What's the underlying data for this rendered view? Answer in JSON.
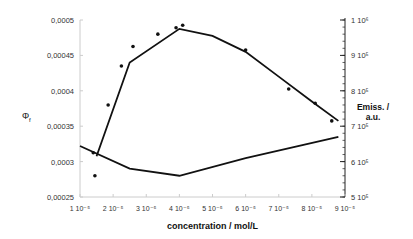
{
  "chart_data": {
    "type": "line",
    "title": "",
    "xlabel": "concentration / mol/L",
    "ylabel_left": "Φf",
    "ylabel_right": "Emiss. / a.u.",
    "xlim": [
      1e-05,
      9e-05
    ],
    "ylim_left": [
      0.00025,
      0.0005
    ],
    "ylim_right": [
      500000,
      1000000
    ],
    "x_ticks": [
      "1 10⁻⁵",
      "2 10⁻⁵",
      "3 10⁻⁵",
      "4 10⁻⁵",
      "5 10⁻⁵",
      "6 10⁻⁵",
      "7 10⁻⁵",
      "8 10⁻⁵",
      "9 10⁻⁵"
    ],
    "y_ticks_left": [
      "0,00025",
      "0,0003",
      "0,00035",
      "0,0004",
      "0,00045",
      "0,0005"
    ],
    "y_ticks_right": [
      "5 10⁵",
      "6 10⁵",
      "7 10⁵",
      "8 10⁵",
      "9 10⁵",
      "1 10⁶"
    ],
    "series": [
      {
        "name": "Emission",
        "axis": "right",
        "points": [
          [
            1.4e-05,
            625000
          ],
          [
            1.85e-05,
            760000
          ],
          [
            2.25e-05,
            870000
          ],
          [
            2.6e-05,
            925000
          ],
          [
            3.35e-05,
            960000
          ],
          [
            3.9e-05,
            978000
          ],
          [
            4.1e-05,
            985000
          ],
          [
            6e-05,
            915000
          ],
          [
            7.3e-05,
            805000
          ],
          [
            8.1e-05,
            765000
          ],
          [
            8.6e-05,
            715000
          ]
        ],
        "line": [
          [
            1.5e-05,
            615000
          ],
          [
            2.5e-05,
            880000
          ],
          [
            4e-05,
            975000
          ],
          [
            5e-05,
            955000
          ],
          [
            6e-05,
            910000
          ],
          [
            7e-05,
            840000
          ],
          [
            8e-05,
            770000
          ],
          [
            8.8e-05,
            715000
          ]
        ]
      },
      {
        "name": "Φf",
        "axis": "left",
        "points": [
          [
            1.45e-05,
            0.00028
          ]
        ],
        "line": [
          [
            1e-05,
            0.000322
          ],
          [
            2.5e-05,
            0.00029
          ],
          [
            4e-05,
            0.00028
          ],
          [
            6e-05,
            0.000305
          ],
          [
            8.8e-05,
            0.000335
          ]
        ]
      }
    ]
  }
}
